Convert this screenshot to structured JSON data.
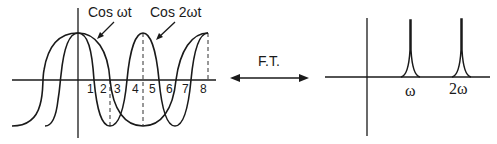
{
  "left_plot": {
    "curve_labels": {
      "cos_wt": "Cos ωt",
      "cos_2wt": "Cos 2ωt"
    },
    "tick_labels": [
      "1",
      "2",
      "3",
      "4",
      "5",
      "6",
      "7",
      "8"
    ]
  },
  "transform": {
    "label": "F.T."
  },
  "right_plot": {
    "peak_labels": [
      "ω",
      "2ω"
    ]
  },
  "colors": {
    "stroke": "#1a1a1a",
    "background": "#ffffff"
  }
}
